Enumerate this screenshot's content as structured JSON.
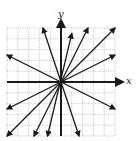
{
  "chart_data": {
    "type": "line",
    "title": "",
    "xlabel": "x",
    "ylabel": "y",
    "xlim": [
      -5,
      5
    ],
    "ylim": [
      -5,
      5
    ],
    "grid": true,
    "legend": null,
    "series": [
      {
        "name": "line slope -3",
        "slope": -3,
        "x": [
          -1.67,
          1.67
        ],
        "y": [
          5,
          -5
        ]
      },
      {
        "name": "line slope 4",
        "slope": 4,
        "x": [
          -1.25,
          1.0
        ],
        "y": [
          -5,
          4.5
        ]
      },
      {
        "name": "line slope 2",
        "slope": 2,
        "x": [
          -2.5,
          2.5
        ],
        "y": [
          -5,
          5
        ]
      },
      {
        "name": "line slope 1",
        "slope": 1,
        "x": [
          -5,
          5
        ],
        "y": [
          -5,
          5
        ]
      },
      {
        "name": "line slope 0.5",
        "slope": 0.5,
        "x": [
          -5,
          5
        ],
        "y": [
          -2.5,
          2.5
        ]
      },
      {
        "name": "line slope -0.5",
        "slope": -0.5,
        "x": [
          -5,
          5
        ],
        "y": [
          2.5,
          -2.5
        ]
      }
    ],
    "axes": {
      "x_arrow": true,
      "y_arrow": true
    }
  },
  "labels": {
    "x": "x",
    "y": "y"
  },
  "colors": {
    "line": "#1a1a1a",
    "grid": "#9a9a9a",
    "background": "#ffffff"
  }
}
